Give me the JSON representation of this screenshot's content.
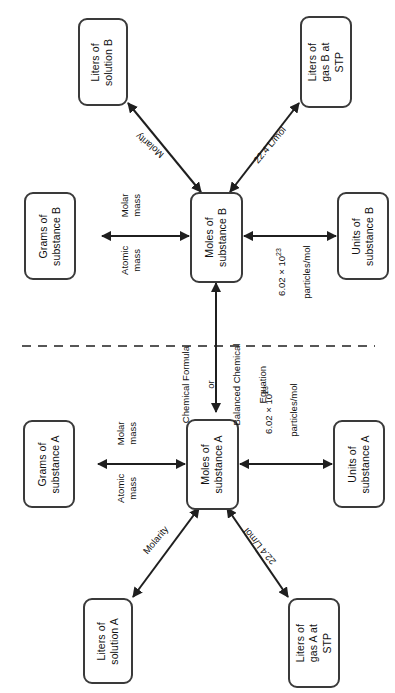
{
  "diagram": {
    "orientation": "rotated-90-ccw",
    "divider": "dashed-separator",
    "colors": {
      "box_border": "#3a3a3a",
      "arrow": "#1f1f1f",
      "background": "#ffffff",
      "text": "#111111"
    }
  },
  "nodes": {
    "moles_b": "Moles of\nsubstance B",
    "grams_b": "Grams of\nsubstance B",
    "units_b": "Units of\nsubstance B",
    "liters_solution_b": "Liters of\nsolution B",
    "liters_gas_b": "Liters of\ngas B at\nSTP",
    "moles_a": "Moles of\nsubstance A",
    "grams_a": "Grams of\nsubstance A",
    "units_a": "Units of\nsubstance A",
    "liters_solution_a": "Liters of\nsolution A",
    "liters_gas_a": "Liters of\ngas A at\nSTP"
  },
  "edge_labels": {
    "molar_mass_b": "Molar\nmass",
    "atomic_mass_b": "Atomic\nmass",
    "molarity_b": "Molarity",
    "molar_volume_b": "22.4 L/mol",
    "avogadro_b_line1": "6.02 × 10",
    "avogadro_b_exp": "23",
    "avogadro_b_line2": "particles/mol",
    "molar_mass_a": "Molar\nmass",
    "atomic_mass_a": "Atomic\nmass",
    "molarity_a": "Molarity",
    "molar_volume_a": "22.4 L/mol",
    "avogadro_a_line1": "6.02 × 10",
    "avogadro_a_exp": "23",
    "avogadro_a_line2": "particles/mol",
    "bridge_line1": "Chemical Formula",
    "bridge_line2": "or",
    "bridge_line3": "Balanced Chemical",
    "bridge_line4": "Equation"
  }
}
